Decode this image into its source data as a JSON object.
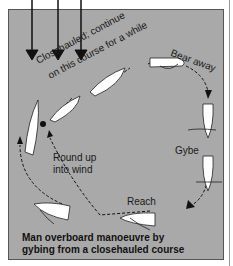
{
  "diagram": {
    "wind_arrows": 3,
    "labels": {
      "closehauled_line1": "Closehauled; continue",
      "closehauled_line2": "on this course for a while",
      "bear_away": "Bear away",
      "gybe": "Gybe",
      "reach": "Reach",
      "round_up_line1": "Round up",
      "round_up_line2": "into wind"
    },
    "caption": {
      "line1": "Man overboard manoeuvre by",
      "line2": "gybing from a closehauled course"
    },
    "colors": {
      "background": "#a9a9a9",
      "boat": "#ffffff",
      "line": "#111111"
    }
  }
}
